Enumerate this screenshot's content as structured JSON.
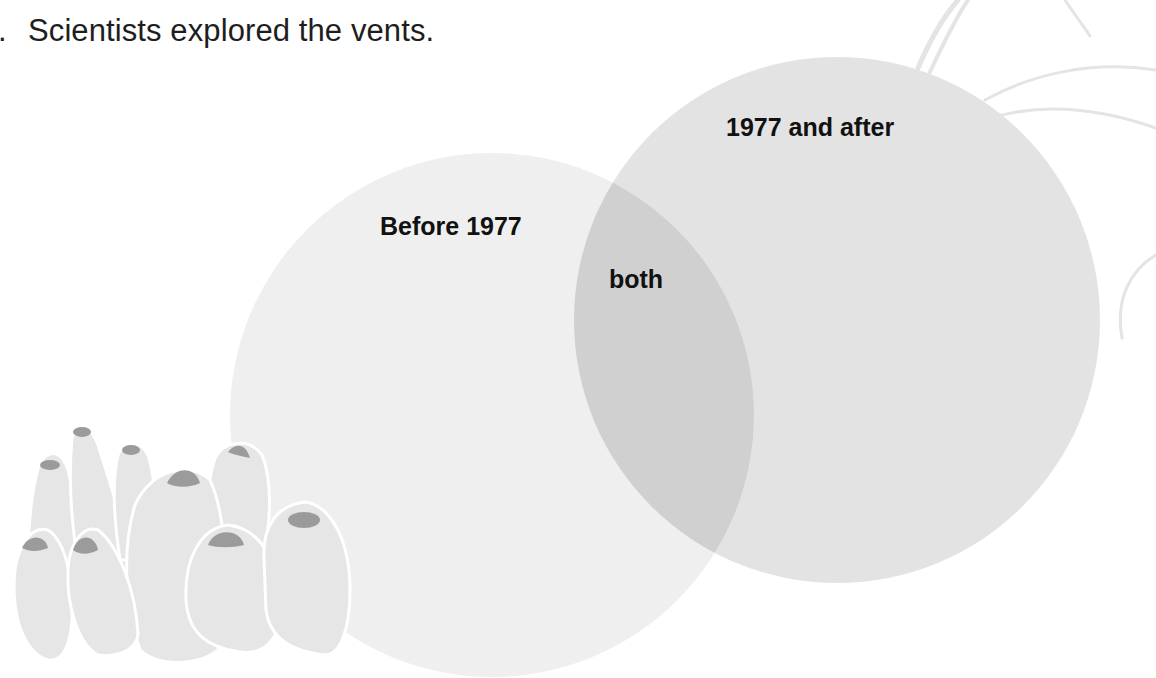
{
  "prompt": {
    "number_fragment": ".",
    "text": "Scientists explored the vents."
  },
  "diagram": {
    "type": "venn",
    "sets": [
      {
        "id": "left",
        "label": "Before 1977",
        "fill": "#efefef"
      },
      {
        "id": "right",
        "label": "1977 and after",
        "fill": "#e3e3e3"
      }
    ],
    "overlap": {
      "label": "both",
      "fill": "#d0d0d0"
    }
  },
  "decorations": {
    "barnacle_cluster": {
      "body_fill": "#e6e6e6",
      "cap_fill": "#9b9b9b",
      "outline": "#ffffff"
    },
    "tube_worm_lines": {
      "stroke": "#e4e4e4"
    }
  }
}
